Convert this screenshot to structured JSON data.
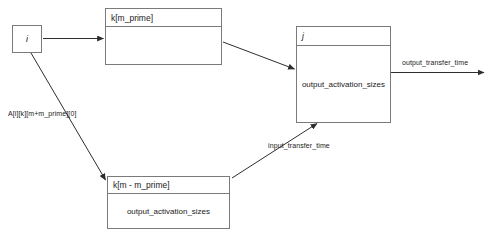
{
  "diagram": {
    "title_box_i": "i",
    "nodes": [
      {
        "id": "node-i",
        "label": "i",
        "kind": "small-node",
        "italic": true
      },
      {
        "id": "node-k-m-prime",
        "title": "k[m_prime]",
        "body": "",
        "kind": "uml-box"
      },
      {
        "id": "node-k-m-minus-m-prime",
        "title": "k[m - m_prime]",
        "body": "output_activation_sizes",
        "kind": "uml-box"
      },
      {
        "id": "node-j",
        "title": "j",
        "body": "output_activation_sizes",
        "kind": "uml-box",
        "italic": true
      }
    ],
    "edges": [
      {
        "id": "edge-i-to-k-m-prime",
        "label": "",
        "from": "node-i",
        "to": "node-k-m-prime"
      },
      {
        "id": "edge-i-to-k-m-minus-m-prime",
        "label": "A[i][k][m+m_prime][0]",
        "from": "node-i",
        "to": "node-k-m-minus-m-prime"
      },
      {
        "id": "edge-k-m-prime-to-j",
        "label": "",
        "from": "node-k-m-prime",
        "to": "node-j"
      },
      {
        "id": "edge-k-m-minus-to-j",
        "label": "input_transfer_time",
        "from": "node-k-m-minus-m-prime",
        "to": "node-j"
      },
      {
        "id": "edge-j-output",
        "label": "output_transfer_time",
        "from": "node-j",
        "to": "outside"
      }
    ],
    "colors": {
      "border": "#7a7a7a",
      "stroke": "#3a3a3a",
      "text": "#1a1a1a",
      "background": "#ffffff"
    }
  }
}
